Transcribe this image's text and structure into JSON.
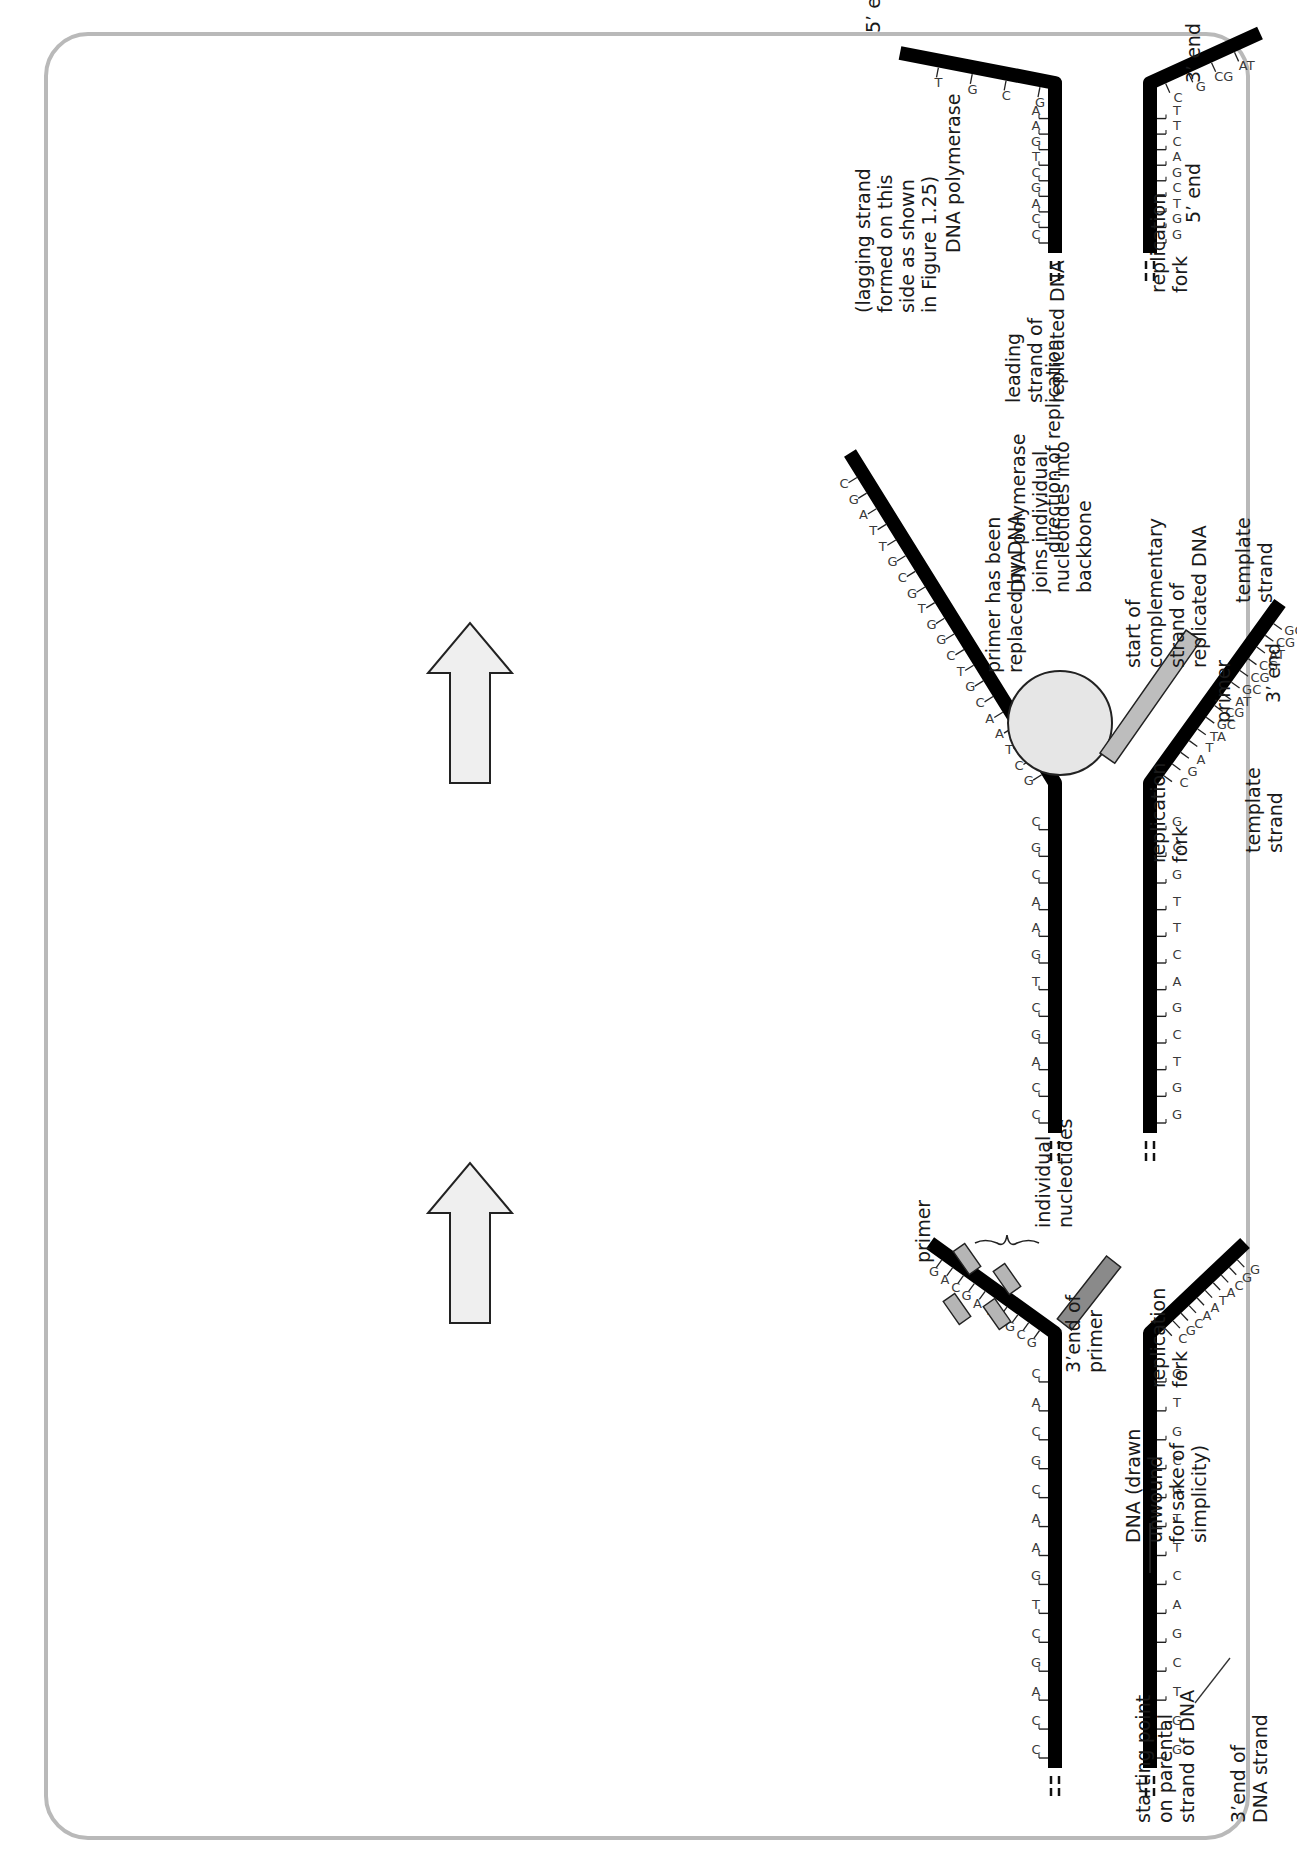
{
  "figure": {
    "border_color": "#b9b9b9",
    "strand_color": "#000000",
    "polymerase_fill": "#e6e6e6",
    "new_strand_fill": "#bdbdbd",
    "primer_fill": "#8a8a8a",
    "arrow_fill": "#efefef"
  },
  "panels": [
    {
      "id": "step1",
      "labels": {
        "dna_unwound": [
          "DNA (drawn",
          "unwound",
          "for sake of",
          "simplicity)"
        ],
        "replication_fork": [
          "replication",
          "fork"
        ],
        "three_end_primer": [
          "3’end of",
          "primer"
        ],
        "individual_nucleotides": [
          "individual",
          "nucleotides"
        ],
        "primer": [
          "primer"
        ],
        "starting_point": [
          "starting point",
          "on parental",
          "strand of DNA"
        ],
        "three_end_dna": [
          "3’end of",
          "DNA strand"
        ]
      },
      "duplex_pairs": [
        "CG",
        "CG",
        "AT",
        "GC",
        "CG",
        "TA",
        "GC",
        "AT",
        "AT",
        "CG",
        "GC",
        "CG",
        "AT",
        "CG",
        "GC",
        "TA",
        "CG",
        "GC",
        "AT",
        "TA",
        "TA",
        "GC",
        "CG",
        "AT",
        "GC",
        "CG",
        "CG",
        "AT"
      ],
      "upper_arm_bases": [
        "G",
        "C",
        "G",
        "T",
        "T",
        "A",
        "G",
        "C",
        "A",
        "G"
      ],
      "lower_arm_bases": [
        "C",
        "G",
        "C",
        "A",
        "A",
        "T",
        "A",
        "C",
        "G",
        "G",
        "C",
        "T",
        "A",
        "C",
        "G"
      ],
      "free_nucleotides": [
        "T",
        "C",
        "A",
        "G"
      ]
    },
    {
      "id": "step2",
      "labels": {
        "polymerase_joins": [
          "DNA polymerase",
          "joins individual",
          "nucleotides into",
          "backbone"
        ],
        "replication_fork": [
          "replication",
          "fork"
        ],
        "template_strand": [
          "template",
          "strand"
        ],
        "start_complementary": [
          "start of",
          "complementary",
          "strand of",
          "replicated DNA"
        ],
        "primer": [
          "primer"
        ]
      },
      "duplex_pairs": [
        "CG",
        "CG",
        "AT",
        "GC",
        "CG",
        "TA",
        "GC",
        "AT",
        "AT",
        "CG",
        "GC",
        "CG",
        "AT",
        "CG",
        "GC",
        "TA",
        "CG",
        "GC",
        "AT",
        "TA",
        "AT",
        "GC",
        "CG",
        "AT",
        "AT",
        "GC",
        "TA"
      ],
      "upper_arm_bases": [
        "G",
        "C",
        "T",
        "A",
        "A",
        "C",
        "G",
        "T",
        "C",
        "G",
        "G",
        "T",
        "G",
        "C",
        "G",
        "T",
        "T",
        "A",
        "G",
        "C",
        "A",
        "G"
      ],
      "lower_arm_bases": [
        "C",
        "G",
        "A",
        "T",
        "TA",
        "GC",
        "CG",
        "AT",
        "GC",
        "CG",
        "CG",
        "AT",
        "CG",
        "GC",
        "CG",
        "AT",
        "AT",
        "TA",
        "CG",
        "GC",
        "TA",
        "CG"
      ]
    },
    {
      "id": "step3",
      "labels": {
        "five_end_left": [
          "5’ end"
        ],
        "three_end_left": [
          "3’ end"
        ],
        "dna_polymerase": [
          "DNA polymerase"
        ],
        "replication_fork": [
          "replication",
          "fork"
        ],
        "leading_strand": [
          "leading",
          "strand of",
          "replicated DNA"
        ],
        "lagging_strand": [
          "(lagging strand",
          "formed on this",
          "side as shown",
          "in Figure 1.25)"
        ],
        "template_strand": [
          "template",
          "strand"
        ],
        "direction": "direction of replication",
        "primer_replaced": [
          "primer has been",
          "replaced by DNA"
        ],
        "five_end_right": [
          "5’ end"
        ],
        "three_end_right": [
          "3’ end"
        ]
      },
      "duplex_pairs": [
        "CG",
        "CG",
        "AT",
        "GC",
        "CG",
        "TA",
        "GC",
        "AT",
        "AT"
      ],
      "upper_arm_bases": [
        "G",
        "C",
        "G",
        "T",
        "G",
        "C",
        "G",
        "T",
        "A",
        "T",
        "G",
        "C",
        "T",
        "G",
        "T",
        "T",
        "C",
        "A",
        "G",
        "C",
        "T",
        "A",
        "A",
        "C",
        "G",
        "T",
        "C",
        "G",
        "G",
        "T",
        "G",
        "C",
        "G",
        "T",
        "T",
        "A",
        "G",
        "C",
        "A",
        "G"
      ],
      "lower_arm_bases": [
        "C",
        "G",
        "CG",
        "AT",
        "GC",
        "CG",
        "AT",
        "TA",
        "AT",
        "CG",
        "GC",
        "AT",
        "CG",
        "AT",
        "AT",
        "GC",
        "TA",
        "CG",
        "GC",
        "AT",
        "TA",
        "AT",
        "GC",
        "CG",
        "AT",
        "GC",
        "CG",
        "CG",
        "AT",
        "CG",
        "GC",
        "CG",
        "AT",
        "AT",
        "TA",
        "CG",
        "GC",
        "TA",
        "CG"
      ]
    }
  ],
  "step_arrows": [
    {
      "name": "step-arrow-1-to-2"
    },
    {
      "name": "step-arrow-2-to-3"
    }
  ]
}
